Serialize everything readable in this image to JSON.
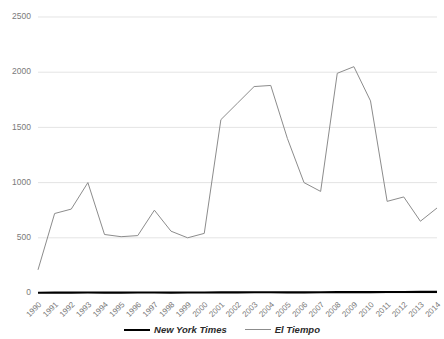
{
  "chart_data": {
    "type": "line",
    "title": "",
    "xlabel": "",
    "ylabel": "",
    "ylim": [
      0,
      2500
    ],
    "ytick_labels": [
      "0",
      "500",
      "1000",
      "1500",
      "2000",
      "2500"
    ],
    "ytick_values": [
      0,
      500,
      1000,
      1500,
      2000,
      2500
    ],
    "grid": true,
    "legend_position": "bottom-center",
    "categories": [
      "1990",
      "1991",
      "1992",
      "1993",
      "1994",
      "1995",
      "1996",
      "1997",
      "1998",
      "1999",
      "2000",
      "2001",
      "2002",
      "2003",
      "2004",
      "2005",
      "2006",
      "2007",
      "2008",
      "2009",
      "2010",
      "2011",
      "2012",
      "2013",
      "2014"
    ],
    "series": [
      {
        "name": "New York Times",
        "color": "#000000",
        "values": [
          2,
          3,
          3,
          4,
          3,
          3,
          4,
          4,
          3,
          4,
          5,
          6,
          6,
          7,
          7,
          6,
          6,
          7,
          8,
          8,
          8,
          9,
          9,
          10,
          10
        ]
      },
      {
        "name": "El Tiempo",
        "color": "#8c8c8c",
        "values": [
          210,
          720,
          760,
          1000,
          530,
          510,
          520,
          750,
          560,
          500,
          540,
          1570,
          1720,
          1870,
          1880,
          1400,
          1000,
          920,
          1990,
          2050,
          1740,
          830,
          870,
          650,
          770
        ]
      }
    ]
  },
  "legend": {
    "entries": [
      {
        "label": "New York Times"
      },
      {
        "label": "El Tiempo"
      }
    ]
  },
  "colors": {
    "nyt": "#000000",
    "tiempo": "#8c8c8c",
    "grid": "#d9d9d9",
    "tick_text": "#7a7a7a"
  }
}
